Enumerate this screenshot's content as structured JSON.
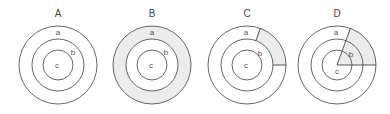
{
  "diagram": {
    "colors": {
      "stroke": "#555555",
      "shade": "#ececec",
      "text": "#444444",
      "background": "#ffffff"
    },
    "panels": [
      {
        "id": "A",
        "title": "A",
        "center_x": 58,
        "labels": {
          "a": "a",
          "b": "b",
          "c": "c"
        },
        "shading": "none"
      },
      {
        "id": "B",
        "title": "B",
        "center_x": 152,
        "labels": {
          "a": "a",
          "b": "b",
          "c": "c"
        },
        "shading": "entire outer ring (region a)"
      },
      {
        "id": "C",
        "title": "C",
        "center_x": 247,
        "labels": {
          "a": "a",
          "b": "b",
          "c": "c"
        },
        "shading": "sector of outer ring between ~70° and 0° (upper right)"
      },
      {
        "id": "D",
        "title": "D",
        "center_x": 337,
        "labels": {
          "a": "a",
          "b": "b",
          "c": "c"
        },
        "shading": "full pie sector from center to outer circle between ~70° and 0° (upper right)"
      }
    ]
  }
}
